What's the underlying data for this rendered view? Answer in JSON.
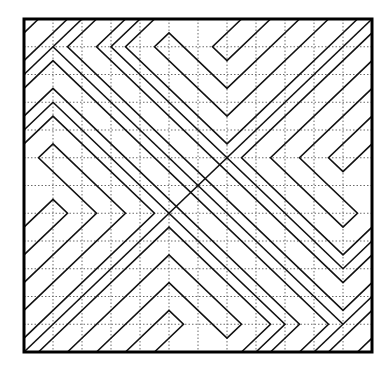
{
  "diagram": {
    "title": "",
    "type": "line-pattern",
    "colors": {
      "line": "#111111",
      "grid": "#6b6b6b",
      "frame": "#000000",
      "background": "#ffffff"
    },
    "frame": {
      "x": 24,
      "y": 19,
      "width": 348,
      "height": 333
    },
    "grid": {
      "cols": 12,
      "rows": 12,
      "style": "dotted"
    },
    "paths": [
      [
        [
          7.5,
          0
        ],
        [
          6.5,
          1
        ],
        [
          7,
          1.5
        ],
        [
          8.5,
          0
        ]
      ],
      [
        [
          9.5,
          0
        ],
        [
          7,
          2.5
        ],
        [
          5,
          0.5
        ],
        [
          4.5,
          1
        ],
        [
          7,
          3.5
        ],
        [
          10.5,
          0
        ]
      ],
      [
        [
          4.5,
          0
        ],
        [
          3.5,
          1
        ],
        [
          7,
          4.5
        ],
        [
          11.5,
          0
        ]
      ],
      [
        [
          4,
          0
        ],
        [
          3,
          1
        ],
        [
          11,
          9
        ],
        [
          12,
          8
        ]
      ],
      [
        [
          3.5,
          0
        ],
        [
          2.5,
          1
        ],
        [
          11,
          9.5
        ],
        [
          12,
          8.5
        ]
      ],
      [
        [
          2.5,
          0
        ],
        [
          1.5,
          1
        ],
        [
          11,
          10.5
        ],
        [
          12,
          9.5
        ]
      ],
      [
        [
          0,
          7.5
        ],
        [
          1,
          6.5
        ],
        [
          1.5,
          7
        ],
        [
          0,
          8.5
        ]
      ],
      [
        [
          0,
          9.5
        ],
        [
          2.5,
          7
        ],
        [
          0.5,
          5
        ],
        [
          1,
          4.5
        ],
        [
          3.5,
          7
        ],
        [
          0,
          10.5
        ]
      ],
      [
        [
          0,
          4.5
        ],
        [
          1,
          3.5
        ],
        [
          4.5,
          7
        ],
        [
          0,
          11.5
        ]
      ],
      [
        [
          0,
          4
        ],
        [
          1,
          3
        ],
        [
          9,
          11
        ],
        [
          8,
          12
        ]
      ],
      [
        [
          0,
          3.5
        ],
        [
          1,
          2.5
        ],
        [
          9.5,
          11
        ],
        [
          8.5,
          12
        ]
      ],
      [
        [
          0,
          2.5
        ],
        [
          1,
          1.5
        ],
        [
          10.5,
          11
        ],
        [
          9.5,
          12
        ]
      ],
      [
        [
          4.5,
          12
        ],
        [
          5.5,
          11
        ],
        [
          5,
          10.5
        ],
        [
          3.5,
          12
        ]
      ],
      [
        [
          2.5,
          12
        ],
        [
          5,
          9.5
        ],
        [
          7,
          11.5
        ],
        [
          7.5,
          11
        ],
        [
          5,
          8.5
        ],
        [
          1.5,
          12
        ]
      ],
      [
        [
          7.5,
          12
        ],
        [
          8.5,
          11
        ],
        [
          5,
          7.5
        ],
        [
          0.5,
          12
        ]
      ],
      [
        [
          12,
          4.5
        ],
        [
          11,
          5.5
        ],
        [
          10.5,
          5
        ],
        [
          12,
          3.5
        ]
      ],
      [
        [
          12,
          2.5
        ],
        [
          9.5,
          5
        ],
        [
          11.5,
          7
        ],
        [
          11,
          7.5
        ],
        [
          8.5,
          5
        ],
        [
          12,
          1.5
        ]
      ],
      [
        [
          12,
          7.5
        ],
        [
          11,
          8.5
        ],
        [
          7.5,
          5
        ],
        [
          12,
          0.5
        ]
      ],
      [
        [
          0,
          12
        ],
        [
          12,
          0
        ]
      ],
      [
        [
          0,
          2
        ],
        [
          2,
          0
        ]
      ],
      [
        [
          10,
          12
        ],
        [
          12,
          10
        ]
      ],
      [
        [
          1,
          1
        ],
        [
          11,
          11
        ]
      ],
      [
        [
          0,
          1.5
        ],
        [
          1.5,
          0
        ]
      ],
      [
        [
          10.5,
          12
        ],
        [
          12,
          10.5
        ]
      ],
      [
        [
          0,
          0.5
        ],
        [
          0.5,
          0
        ]
      ],
      [
        [
          11.5,
          12
        ],
        [
          12,
          11.5
        ]
      ]
    ]
  }
}
